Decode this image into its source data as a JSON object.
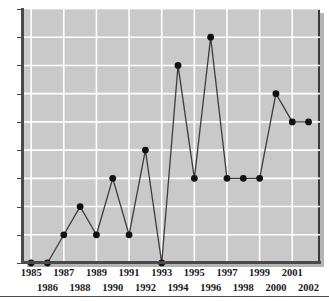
{
  "chart_data": {
    "type": "line",
    "title": "",
    "subtitle": "",
    "xlabel": "",
    "ylabel": "",
    "grid": true,
    "legend": null,
    "marker": "filled-circle",
    "line_color": "#3c3c3c",
    "marker_color": "#111111",
    "plot_background": "#c9c9c9",
    "gridline_color": "#ffffff",
    "axis_color": "#4a4a4a",
    "xlim": [
      1984.5,
      2002.7
    ],
    "ylim": [
      0,
      9
    ],
    "x": [
      1985,
      1986,
      1987,
      1988,
      1989,
      1990,
      1991,
      1992,
      1993,
      1994,
      1995,
      1996,
      1997,
      1998,
      1999,
      2000,
      2001,
      2002
    ],
    "values": [
      0,
      0,
      1,
      2,
      1,
      3,
      1,
      4,
      0,
      7,
      3,
      8,
      3,
      3,
      3,
      6,
      5,
      5
    ],
    "categories": [
      "1985",
      "1986",
      "1987",
      "1988",
      "1989",
      "1990",
      "1991",
      "1992",
      "1993",
      "1994",
      "1995",
      "1996",
      "1997",
      "1998",
      "1999",
      "2000",
      "2001",
      "2002"
    ],
    "yticks": [
      0,
      1,
      2,
      3,
      4,
      5,
      6,
      7,
      8,
      9
    ],
    "ytick_labels": [
      "0",
      "1",
      "2",
      "3",
      "4",
      "5",
      "6",
      "7",
      "8",
      "9"
    ],
    "xticks": [
      1985,
      1986,
      1987,
      1988,
      1989,
      1990,
      1991,
      1992,
      1993,
      1994,
      1995,
      1996,
      1997,
      1998,
      1999,
      2000,
      2001,
      2002
    ],
    "xtick_labels": [
      "1985",
      "1986",
      "1987",
      "1988",
      "1989",
      "1990",
      "1991",
      "1992",
      "1993",
      "1994",
      "1995",
      "1996",
      "1997",
      "1998",
      "1999",
      "2000",
      "2001",
      "2002"
    ],
    "xtick_label_rows": [
      "top",
      "bottom",
      "top",
      "bottom",
      "top",
      "bottom",
      "top",
      "bottom",
      "top",
      "bottom",
      "top",
      "bottom",
      "top",
      "bottom",
      "top",
      "bottom",
      "top",
      "bottom"
    ],
    "vertical_gridlines_at": [
      1985,
      1987,
      1989,
      1991,
      1993,
      1995,
      1997,
      1999,
      2001
    ],
    "horizontal_gridlines_at": [
      1,
      2,
      3,
      4,
      5,
      6,
      7,
      8,
      9
    ]
  }
}
